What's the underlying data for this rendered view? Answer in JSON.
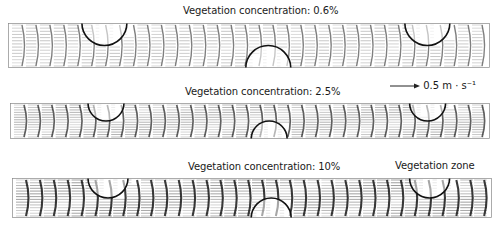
{
  "figure": {
    "panels": [
      {
        "title": "Vegetation concentration: 0.6%",
        "concentration_pct": 0.6,
        "intensity": 0.35
      },
      {
        "title": "Vegetation concentration: 2.5%",
        "concentration_pct": 2.5,
        "intensity": 0.6
      },
      {
        "title": "Vegetation concentration: 10%",
        "concentration_pct": 10,
        "intensity": 0.9
      }
    ],
    "scale_bar": {
      "label": "0.5 m · s⁻¹",
      "value": 0.5,
      "unit": "m · s⁻¹"
    },
    "annotation": {
      "label": "Vegetation zone"
    },
    "vegetation_zones": [
      {
        "position": "top",
        "cx_frac": 0.2
      },
      {
        "position": "bottom",
        "cx_frac": 0.54
      },
      {
        "position": "top",
        "cx_frac": 0.87
      }
    ],
    "colors": {
      "vector": "#1a1a1a",
      "circle": "#111111",
      "frame": "#888888"
    }
  }
}
